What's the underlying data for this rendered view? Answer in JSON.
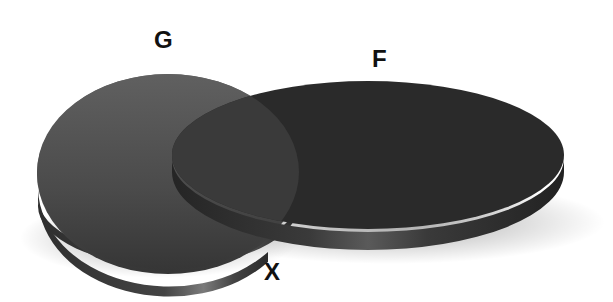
{
  "diagram": {
    "type": "venn-3d-discs",
    "sets": [
      {
        "id": "G",
        "label": "G",
        "color": "#575757",
        "side_color": "#3a3a3a"
      },
      {
        "id": "F",
        "label": "F",
        "color": "#2a2a2a",
        "side_color": "#3c3c3c"
      }
    ],
    "intersection": {
      "label": "X",
      "color": "#383838"
    },
    "background": "#ffffff"
  }
}
